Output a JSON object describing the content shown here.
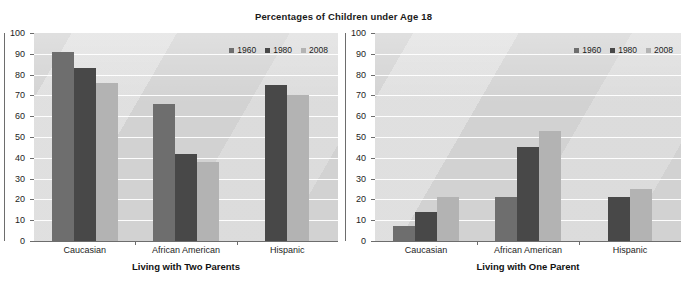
{
  "title": "Percentages of Children under Age 18",
  "series_colors": {
    "1960": "#6e6e6e",
    "1980": "#484848",
    "2008": "#b3b3b3"
  },
  "plot_bg": "#d2d2d2",
  "axis_color": "#6d6d6d",
  "y_ticks": [
    "100",
    "90",
    "80",
    "70",
    "60",
    "50",
    "40",
    "30",
    "20",
    "10",
    "0"
  ],
  "legend": {
    "items": [
      "1960",
      "1980",
      "2008"
    ]
  },
  "chart_data": [
    {
      "type": "bar",
      "title": "Percentages of Children under Age 18",
      "xlabel": "Living with Two Parents",
      "ylabel": "",
      "ylim": [
        0,
        100
      ],
      "ytick_step": 10,
      "grid": true,
      "legend_position": "top-right",
      "categories": [
        "Caucasian",
        "African American",
        "Hispanic"
      ],
      "series": [
        {
          "name": "1960",
          "values": [
            91,
            66,
            null
          ]
        },
        {
          "name": "1980",
          "values": [
            83,
            42,
            75
          ]
        },
        {
          "name": "2008",
          "values": [
            76,
            38,
            70
          ]
        }
      ]
    },
    {
      "type": "bar",
      "title": "Percentages of Children under Age 18",
      "xlabel": "Living with One Parent",
      "ylabel": "",
      "ylim": [
        0,
        100
      ],
      "ytick_step": 10,
      "grid": true,
      "legend_position": "top-right",
      "categories": [
        "Caucasian",
        "African American",
        "Hispanic"
      ],
      "series": [
        {
          "name": "1960",
          "values": [
            7,
            21,
            null
          ]
        },
        {
          "name": "1980",
          "values": [
            14,
            45,
            21
          ]
        },
        {
          "name": "2008",
          "values": [
            21,
            53,
            25
          ]
        }
      ]
    }
  ]
}
